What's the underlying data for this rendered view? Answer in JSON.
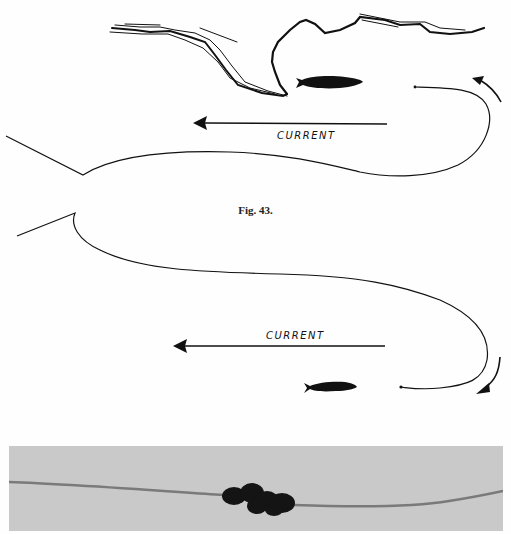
{
  "figure": {
    "caption": "Fig. 43.",
    "top_diagram": {
      "current_label": "CURRENT",
      "elements": [
        "riverbank-outline",
        "fish-silhouette",
        "current-arrow",
        "line-loop",
        "curved-direction-arrow"
      ]
    },
    "bottom_diagram": {
      "current_label": "CURRENT",
      "elements": [
        "line-loop",
        "current-arrow",
        "fish-silhouette",
        "curved-direction-arrow"
      ]
    },
    "photo": {
      "description": "Line with knotted tangle",
      "background_color": "#c9c9c9"
    }
  },
  "colors": {
    "ink": "#111111",
    "paper": "#fefefe",
    "photo_bg": "#c9c9c9",
    "photo_line": "#7a7a7a"
  }
}
